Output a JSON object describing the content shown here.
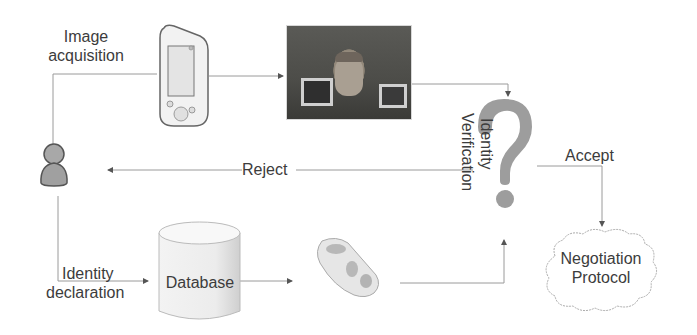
{
  "diagram": {
    "nodes": {
      "image_acquisition": {
        "label_line1": "Image",
        "label_line2": "acquisition"
      },
      "pda_device": {
        "icon": "pda-icon"
      },
      "face_photo": {
        "icon": "face-photo"
      },
      "user": {
        "icon": "user-icon"
      },
      "identity_declaration": {
        "label_line1": "Identity",
        "label_line2": "declaration"
      },
      "database": {
        "label": "Database"
      },
      "face_template": {
        "icon": "3d-face-template"
      },
      "identity_verification": {
        "label_line1": "Identity",
        "label_line2": "Verification",
        "icon": "question-mark-icon"
      },
      "negotiation_protocol": {
        "label_line1": "Negotiation",
        "label_line2": "Protocol"
      }
    },
    "edges": {
      "reject": {
        "label": "Reject"
      },
      "accept": {
        "label": "Accept"
      }
    },
    "colors": {
      "line": "#8a8a8a",
      "question_mark": "#9a9a9a",
      "text": "#3c3c3c"
    }
  }
}
